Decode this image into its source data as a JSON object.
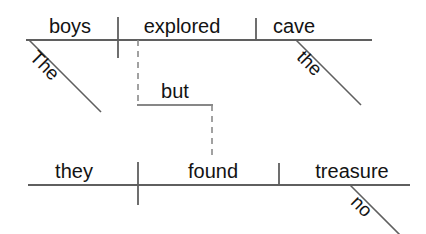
{
  "diagram": {
    "type": "sentence-diagram",
    "sentence": "The boys explored the cave, but they found no treasure.",
    "style": {
      "line_color": "#5f5f5f",
      "dashed_line_color": "#8a8a8a",
      "text_color": "#131313",
      "background": "#ffffff",
      "line_width": 1.6
    },
    "clauses": [
      {
        "name": "independent-clause-1",
        "baseline_y": 40,
        "words": [
          {
            "id": "subject-1",
            "role": "subject",
            "text": "boys",
            "x": 70,
            "y": 36
          },
          {
            "id": "verb-1",
            "role": "verb",
            "text": "explored",
            "x": 182,
            "y": 36
          },
          {
            "id": "object-1",
            "role": "direct-object",
            "text": "cave",
            "x": 294,
            "y": 36
          }
        ],
        "modifiers": [
          {
            "id": "modifier-the-boys",
            "role": "article-modifier",
            "text": "The",
            "modifies": "boys",
            "x": 29,
            "y": 40,
            "angle": 45
          },
          {
            "id": "modifier-the-cave",
            "role": "article-modifier",
            "text": "the",
            "modifies": "cave",
            "x": 296,
            "y": 40,
            "angle": 45
          }
        ]
      },
      {
        "name": "independent-clause-2",
        "baseline_y": 185,
        "words": [
          {
            "id": "subject-2",
            "role": "subject",
            "text": "they",
            "x": 74,
            "y": 181
          },
          {
            "id": "verb-2",
            "role": "verb",
            "text": "found",
            "x": 213,
            "y": 181
          },
          {
            "id": "object-2",
            "role": "direct-object",
            "text": "treasure",
            "x": 352,
            "y": 181
          }
        ],
        "modifiers": [
          {
            "id": "modifier-no-treasure",
            "role": "adjective-modifier",
            "text": "no",
            "modifies": "treasure",
            "x": 350,
            "y": 185,
            "angle": 45
          }
        ]
      }
    ],
    "connector": {
      "id": "conjunction-connector",
      "role": "coordinating-conjunction",
      "text": "but",
      "label_x": 175,
      "label_y": 101,
      "dashed": true
    }
  }
}
